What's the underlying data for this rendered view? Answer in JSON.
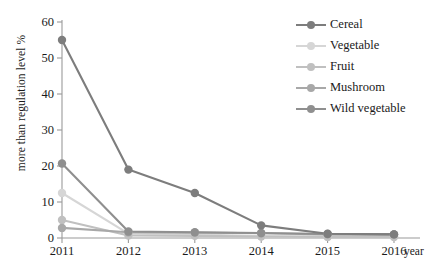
{
  "chart_data": {
    "type": "line",
    "title": "",
    "xlabel": "year",
    "ylabel": "more than regulation level  %",
    "categories": [
      "2011",
      "2012",
      "2013",
      "2014",
      "2015",
      "2016"
    ],
    "x": [
      2011,
      2012,
      2013,
      2014,
      2015,
      2016
    ],
    "ylim": [
      0,
      60
    ],
    "yticks": [
      0,
      10,
      20,
      30,
      40,
      50,
      60
    ],
    "grid": false,
    "legend_position": "top-right",
    "series": [
      {
        "name": "Cereal",
        "color": "#7d7d7d",
        "values": [
          55.0,
          19.0,
          12.5,
          3.5,
          1.2,
          1.0
        ]
      },
      {
        "name": "Vegetable",
        "color": "#d6d6d6",
        "values": [
          12.5,
          1.2,
          1.0,
          0.5,
          0.4,
          0.4
        ]
      },
      {
        "name": "Fruit",
        "color": "#c0c0c0",
        "values": [
          5.0,
          0.7,
          0.6,
          0.4,
          0.3,
          0.3
        ]
      },
      {
        "name": "Mushroom",
        "color": "#a8a8a8",
        "values": [
          2.8,
          1.6,
          1.5,
          1.3,
          1.0,
          1.0
        ]
      },
      {
        "name": "Wild vegetable",
        "color": "#8f8f8f",
        "values": [
          20.7,
          1.8,
          1.6,
          1.4,
          1.1,
          1.0
        ]
      }
    ]
  },
  "axis": {
    "y_labels": [
      "60",
      "50",
      "40",
      "30",
      "20",
      "10",
      "0"
    ],
    "x_labels": [
      "2011",
      "2012",
      "2013",
      "2014",
      "2015",
      "2016"
    ],
    "x_title": "year",
    "y_title": "more than regulation level  %"
  },
  "legend": {
    "items": [
      {
        "label": "Cereal"
      },
      {
        "label": "Vegetable"
      },
      {
        "label": "Fruit"
      },
      {
        "label": "Mushroom"
      },
      {
        "label": "Wild vegetable"
      }
    ]
  }
}
